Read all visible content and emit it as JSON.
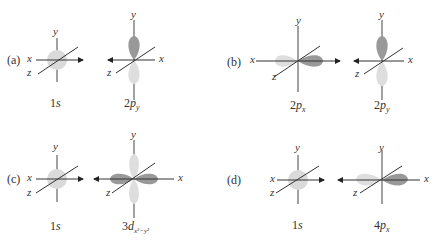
{
  "colors": {
    "light_lobe": "#dcdcdc",
    "dark_lobe": "#9a9a9a",
    "axis": "#444444",
    "s_orbital": "#dadada"
  },
  "axes": {
    "x": "x",
    "y": "y",
    "z": "z"
  },
  "panels": [
    {
      "label": "(a)",
      "left": {
        "name": "1s",
        "main": "1",
        "ital": "s",
        "sub": ""
      },
      "right": {
        "name": "2p_y",
        "main": "2",
        "ital": "p",
        "sub": "y"
      }
    },
    {
      "label": "(b)",
      "left": {
        "name": "2p_x",
        "main": "2",
        "ital": "p",
        "sub": "x"
      },
      "right": {
        "name": "2p_y",
        "main": "2",
        "ital": "p",
        "sub": "y"
      }
    },
    {
      "label": "(c)",
      "left": {
        "name": "1s",
        "main": "1",
        "ital": "s",
        "sub": ""
      },
      "right": {
        "name": "3d_x2-y2",
        "main": "3",
        "ital": "d",
        "sub": "x²−y²"
      }
    },
    {
      "label": "(d)",
      "left": {
        "name": "1s",
        "main": "1",
        "ital": "s",
        "sub": ""
      },
      "right": {
        "name": "4p_x",
        "main": "4",
        "ital": "p",
        "sub": "x"
      }
    }
  ]
}
